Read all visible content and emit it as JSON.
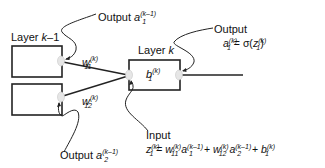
{
  "diagram": {
    "layers": {
      "prev": {
        "label_prefix": "Layer ",
        "label_var": "k",
        "label_suffix": "–1"
      },
      "curr": {
        "label_prefix": "Layer ",
        "label_var": "k"
      }
    },
    "weights": {
      "w11": {
        "base": "w",
        "sub": "11",
        "sup": "(k)"
      },
      "w12": {
        "base": "w",
        "sub": "12",
        "sup": "(k)"
      }
    },
    "bias": {
      "base": "b",
      "sub": "1",
      "sup": "(k)"
    },
    "outputs_prev": {
      "a1": {
        "prefix": "Output ",
        "base": "a",
        "sub": "1",
        "sup": "(k–1)"
      },
      "a2": {
        "prefix": "Output ",
        "base": "a",
        "sub": "2",
        "sup": "(k–1)"
      }
    },
    "output_curr": {
      "title": "Output",
      "lhs_base": "a",
      "lhs_sub": "1",
      "lhs_sup": "(k)",
      "eq": " = σ(",
      "z_base": "z",
      "z_sub": "1",
      "z_sup": "(k)",
      "close": ")"
    },
    "input_curr": {
      "title": "Input",
      "z_base": "z",
      "z_sub": "1",
      "z_sup": "(k)",
      "equals": " = ",
      "t1_w": "w",
      "t1_w_sub": "11",
      "t1_w_sup": "(k)",
      "t1_a": "a",
      "t1_a_sub": "1",
      "t1_a_sup": "(k–1)",
      "plus1": " + ",
      "t2_w": "w",
      "t2_w_sub": "12",
      "t2_w_sup": "(k)",
      "t2_a": "a",
      "t2_a_sub": "2",
      "t2_a_sup": "(k–1)",
      "plus2": " + ",
      "b": "b",
      "b_sub": "1",
      "b_sup": "(k)"
    }
  }
}
